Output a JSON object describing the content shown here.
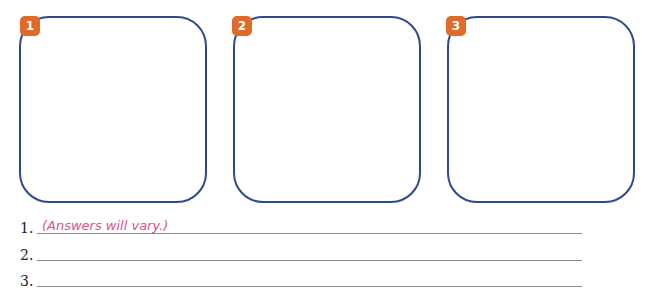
{
  "panels": [
    {
      "number": "1"
    },
    {
      "number": "2"
    },
    {
      "number": "3"
    }
  ],
  "answers": [
    {
      "number": "1.",
      "text": "(Answers will vary.)"
    },
    {
      "number": "2.",
      "text": ""
    },
    {
      "number": "3.",
      "text": ""
    }
  ],
  "colors": {
    "panel_border": "#2c4a8c",
    "badge": "#e06a2a",
    "answer_text": "#e0508a"
  }
}
